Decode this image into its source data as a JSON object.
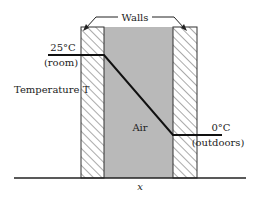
{
  "labels": {
    "walls": "Walls",
    "inside_temp": "25°C",
    "inside_place": "(room)",
    "outside_temp": "0°C",
    "outside_place": "(outdoors)",
    "y_axis": "Temperature T",
    "region": "Air",
    "x_axis": "x"
  },
  "colors": {
    "air_fill": "#b9b9b9",
    "wall_hatch": "#555555",
    "line": "#111111",
    "background": "#ffffff"
  },
  "geometry": {
    "left_wall": [
      81,
      104
    ],
    "air": [
      104,
      173
    ],
    "right_wall": [
      173,
      197
    ],
    "top": 27,
    "baseline": 178,
    "t_high_y": 55,
    "t_low_y": 135
  }
}
